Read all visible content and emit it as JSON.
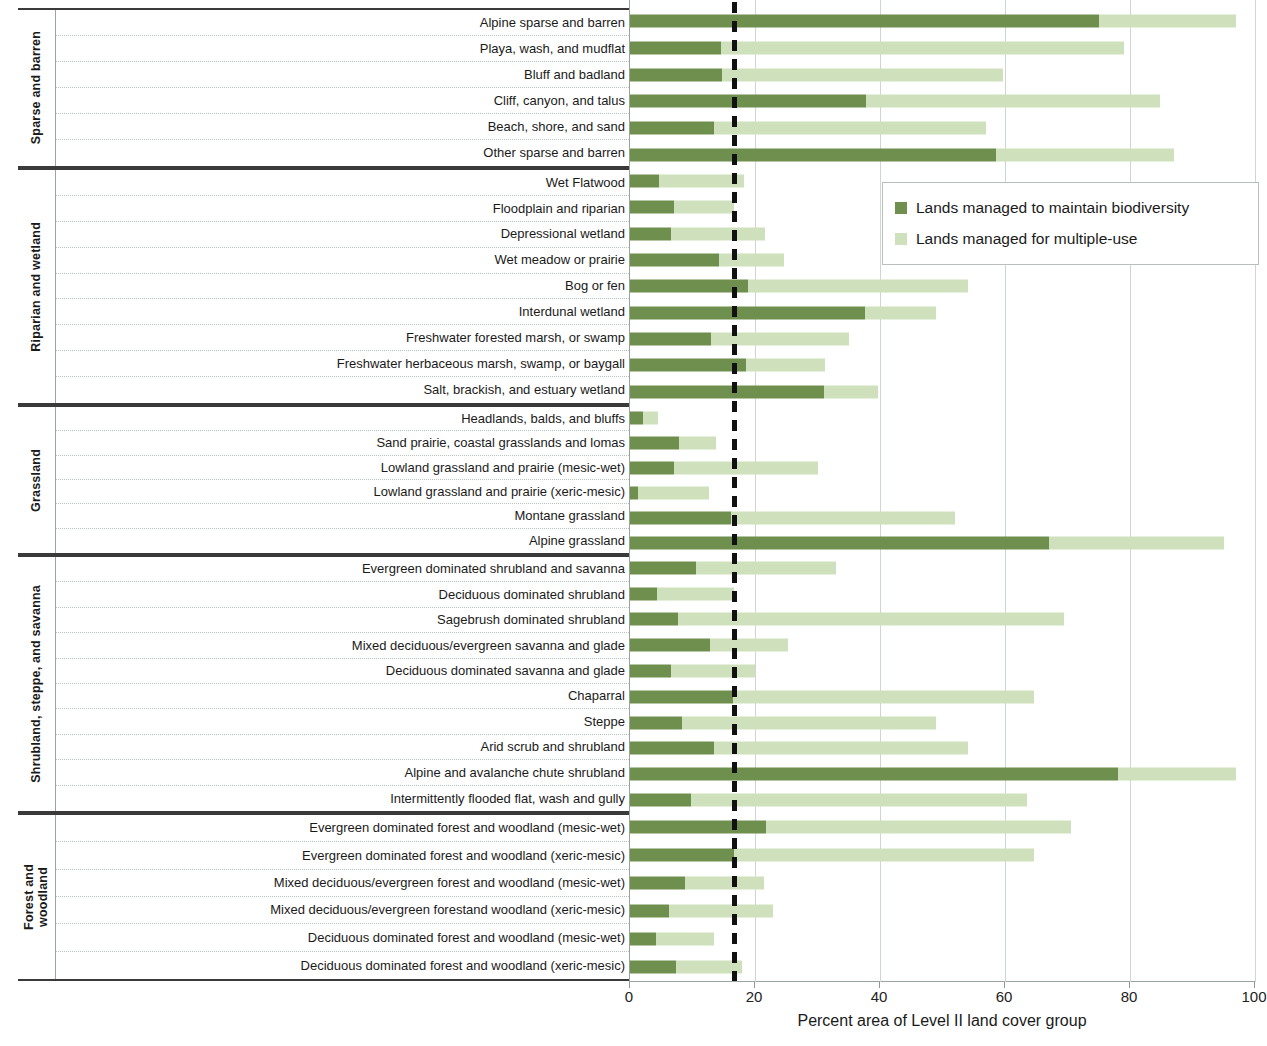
{
  "axis": {
    "title": "Percent area of Level II land cover group",
    "ticks": [
      "0",
      "20",
      "40",
      "60",
      "80",
      "100"
    ],
    "min": 0,
    "max": 100
  },
  "legend": {
    "items": [
      {
        "label": "Lands managed to maintain biodiversity",
        "color": "#6f8f4f",
        "key": "biodiversity"
      },
      {
        "label": "Lands managed for multiple-use",
        "color": "#cfe0bc",
        "key": "multiple_use"
      }
    ]
  },
  "reference_line": {
    "value": 16.6,
    "style": "dashed",
    "color": "#111111"
  },
  "groups": [
    {
      "name": "Sparse and barren"
    },
    {
      "name": "Riparian and wetland"
    },
    {
      "name": "Grassland"
    },
    {
      "name": "Shrubland, steppe, and savanna"
    },
    {
      "name": "Forest and\nwoodland"
    }
  ],
  "chart_data": {
    "type": "bar",
    "orientation": "horizontal",
    "stacked": true,
    "title": "",
    "xlabel": "Percent area of Level II land cover group",
    "ylabel": "",
    "xlim": [
      0,
      100
    ],
    "xticks": [
      0,
      20,
      40,
      60,
      80,
      100
    ],
    "grid": "vertical",
    "legend_position": "upper right inside",
    "annotations": [
      {
        "type": "vertical-dashed-line",
        "x": 16.6,
        "label": ""
      }
    ],
    "series": [
      {
        "name": "Lands managed to maintain biodiversity",
        "color": "#6f8f4f"
      },
      {
        "name": "Lands managed for multiple-use",
        "color": "#cfe0bc"
      }
    ],
    "groups": [
      {
        "group": "Sparse and barren",
        "categories": [
          "Alpine sparse and barren",
          "Playa, wash, and mudflat",
          "Bluff and badland",
          "Cliff, canyon, and talus",
          "Beach, shore, and sand",
          "Other sparse and barren"
        ],
        "biodiversity": [
          75.0,
          14.5,
          14.7,
          37.8,
          13.4,
          58.5
        ],
        "multiple_use": [
          22.0,
          64.5,
          45.0,
          47.0,
          43.6,
          28.5
        ],
        "totals": [
          97.0,
          79.0,
          59.7,
          84.8,
          57.0,
          87.0
        ]
      },
      {
        "group": "Riparian and wetland",
        "categories": [
          "Wet Flatwood",
          "Floodplain and riparian",
          "Depressional wetland",
          "Wet meadow or prairie",
          "Bog or fen",
          "Interdunal wetland",
          "Freshwater forested  marsh, or swamp",
          "Freshwater herbaceous marsh, swamp, or baygall",
          "Salt, brackish, and estuary wetland"
        ],
        "biodiversity": [
          4.6,
          7.0,
          6.5,
          14.3,
          18.8,
          37.6,
          13.0,
          18.6,
          31.0
        ],
        "multiple_use": [
          13.7,
          9.6,
          15.1,
          10.3,
          35.2,
          11.4,
          22.0,
          12.6,
          8.6
        ],
        "totals": [
          18.3,
          16.6,
          21.6,
          24.6,
          54.0,
          49.0,
          35.0,
          31.2,
          39.6
        ]
      },
      {
        "group": "Grassland",
        "categories": [
          "Headlands, balds, and bluffs",
          "Sand prairie, coastal grasslands and lomas",
          "Lowland grassland and prairie (mesic-wet)",
          "Lowland grassland and prairie (xeric-mesic)",
          "Montane grassland",
          "Alpine grassland"
        ],
        "biodiversity": [
          2.0,
          7.9,
          7.0,
          1.3,
          16.2,
          67.0
        ],
        "multiple_use": [
          2.5,
          5.9,
          23.0,
          11.4,
          35.8,
          28.0
        ],
        "totals": [
          4.5,
          13.8,
          30.0,
          12.7,
          52.0,
          95.0
        ]
      },
      {
        "group": "Shrubland, steppe, and savanna",
        "categories": [
          "Evergreen dominated shrubland and savanna",
          "Deciduous dominated shrubland",
          "Sagebrush dominated shrubland",
          "Mixed deciduous/evergreen savanna and glade",
          "Deciduous dominated savanna and glade",
          "Chaparral",
          "Steppe",
          "Arid scrub and shrubland",
          "Alpine and avalanche chute shrubland",
          "Intermittently flooded flat, wash and gully"
        ],
        "biodiversity": [
          10.6,
          4.3,
          7.6,
          12.8,
          6.6,
          16.4,
          8.3,
          13.4,
          78.0,
          9.8
        ],
        "multiple_use": [
          22.4,
          12.3,
          61.9,
          12.4,
          13.4,
          48.2,
          40.7,
          40.6,
          19.0,
          53.7
        ],
        "totals": [
          33.0,
          16.6,
          69.5,
          25.2,
          20.0,
          64.6,
          49.0,
          54.0,
          97.0,
          63.5
        ]
      },
      {
        "group": "Forest and\nwoodland",
        "categories": [
          "Evergreen dominated forest and woodland (mesic-wet)",
          "Evergreen dominated forest and woodland (xeric-mesic)",
          "Mixed deciduous/evergreen forest and woodland (mesic-wet)",
          "Mixed deciduous/evergreen forestand woodland  (xeric-mesic)",
          "Deciduous dominated forest and woodland (mesic-wet)",
          "Deciduous dominated forest and woodland (xeric-mesic)"
        ],
        "biodiversity": [
          21.8,
          16.6,
          8.8,
          6.3,
          4.2,
          7.4
        ],
        "multiple_use": [
          48.7,
          48.0,
          12.6,
          16.6,
          9.3,
          10.5
        ],
        "totals": [
          70.5,
          64.6,
          21.4,
          22.9,
          13.5,
          17.9
        ]
      }
    ]
  }
}
